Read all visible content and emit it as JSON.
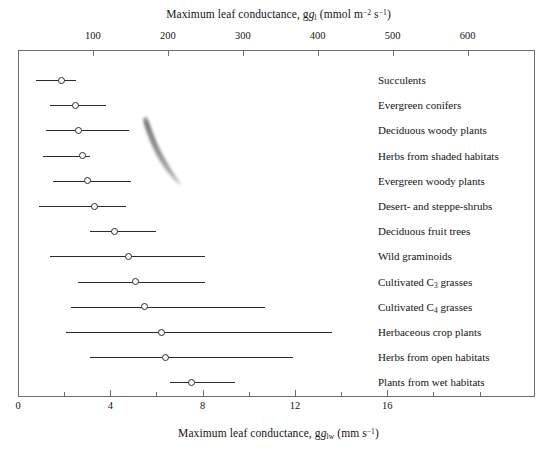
{
  "chart_data": {
    "type": "bar",
    "orientation": "horizontal",
    "title": "",
    "subtitle": "",
    "top_axis": {
      "label_text": "Maximum leaf conductance, g",
      "label_sub": "l",
      "label_unit_open": " (mmol m",
      "label_sup1": "−2",
      "label_mid": " s",
      "label_sup2": "−1",
      "label_close": ")",
      "label_full": "Maximum leaf conductance, gl (mmol m-2 s-1)",
      "ticks": [
        100,
        200,
        300,
        400,
        500,
        600
      ],
      "tick_labels": [
        "100",
        "200",
        "300",
        "400",
        "500",
        "600"
      ],
      "minor_ticks": [
        50,
        150,
        250,
        350,
        450,
        550,
        650
      ],
      "range": [
        0,
        690
      ],
      "units": "mmol m-2 s-1"
    },
    "bottom_axis": {
      "label_text": "Maximum leaf conductance, g",
      "label_sub": "lw",
      "label_unit_open": " (mm s",
      "label_sup1": "−1",
      "label_close": ")",
      "label_full": "Maximum leaf conductance, glw (mm s-1)",
      "ticks": [
        0,
        4,
        8,
        12,
        16
      ],
      "tick_labels": [
        "0",
        "4",
        "8",
        "12",
        "16"
      ],
      "minor_ticks": [
        2,
        6,
        10,
        14,
        18,
        20
      ],
      "range": [
        0,
        22.4
      ],
      "units": "mm s-1"
    },
    "xlabel": "Maximum leaf conductance, glw (mm s-1)",
    "ylabel": "",
    "grid": false,
    "legend": false,
    "value_units": "mm s-1",
    "marker": "open-circle",
    "categories": [
      "Succulents",
      "Evergreen conifers",
      "Deciduous woody plants",
      "Herbs from shaded habitats",
      "Evergreen woody plants",
      "Desert- and steppe-shrubs",
      "Deciduous fruit trees",
      "Wild graminoids",
      "Cultivated C3 grasses",
      "Cultivated C4 grasses",
      "Herbaceous crop plants",
      "Herbs from open habitats",
      "Plants from wet habitats"
    ],
    "rows": [
      {
        "label": "Succulents",
        "label_base": "Succulents",
        "label_sub": "",
        "label_tail": "",
        "low": 0.8,
        "mid": 1.9,
        "high": 2.5
      },
      {
        "label": "Evergreen conifers",
        "label_base": "Evergreen conifers",
        "label_sub": "",
        "label_tail": "",
        "low": 1.4,
        "mid": 2.5,
        "high": 3.8
      },
      {
        "label": "Deciduous woody plants",
        "label_base": "Deciduous woody plants",
        "label_sub": "",
        "label_tail": "",
        "low": 1.2,
        "mid": 2.6,
        "high": 4.8
      },
      {
        "label": "Herbs from shaded habitats",
        "label_base": "Herbs from shaded habitats",
        "label_sub": "",
        "label_tail": "",
        "low": 1.1,
        "mid": 2.8,
        "high": 3.1
      },
      {
        "label": "Evergreen woody plants",
        "label_base": "Evergreen woody plants",
        "label_sub": "",
        "label_tail": "",
        "low": 1.5,
        "mid": 3.0,
        "high": 4.9
      },
      {
        "label": "Desert- and steppe-shrubs",
        "label_base": "Desert- and steppe-shrubs",
        "label_sub": "",
        "label_tail": "",
        "low": 0.9,
        "mid": 3.3,
        "high": 4.7
      },
      {
        "label": "Deciduous fruit trees",
        "label_base": "Deciduous fruit trees",
        "label_sub": "",
        "label_tail": "",
        "low": 3.1,
        "mid": 4.2,
        "high": 6.0
      },
      {
        "label": "Wild graminoids",
        "label_base": "Wild graminoids",
        "label_sub": "",
        "label_tail": "",
        "low": 1.4,
        "mid": 4.8,
        "high": 8.1
      },
      {
        "label": "Cultivated C3 grasses",
        "label_base": "Cultivated C",
        "label_sub": "3",
        "label_tail": " grasses",
        "low": 2.6,
        "mid": 5.1,
        "high": 8.1
      },
      {
        "label": "Cultivated C4 grasses",
        "label_base": "Cultivated C",
        "label_sub": "4",
        "label_tail": " grasses",
        "low": 2.3,
        "mid": 5.5,
        "high": 10.7
      },
      {
        "label": "Herbaceous crop plants",
        "label_base": "Herbaceous crop plants",
        "label_sub": "",
        "label_tail": "",
        "low": 2.1,
        "mid": 6.2,
        "high": 13.6
      },
      {
        "label": "Herbs from open habitats",
        "label_base": "Herbs from open habitats",
        "label_sub": "",
        "label_tail": "",
        "low": 3.1,
        "mid": 6.4,
        "high": 11.9
      },
      {
        "label": "Plants from wet habitats",
        "label_base": "Plants from wet habitats",
        "label_sub": "",
        "label_tail": "",
        "low": 6.6,
        "mid": 7.5,
        "high": 9.4
      }
    ],
    "colors": {
      "line": "#2b2b2b",
      "marker_fill": "#ffffff",
      "marker_stroke": "#2b2b2b",
      "frame": "#6e6e6e",
      "text": "#141414",
      "background": "#ffffff",
      "smudge": "#6a6a6a"
    }
  }
}
